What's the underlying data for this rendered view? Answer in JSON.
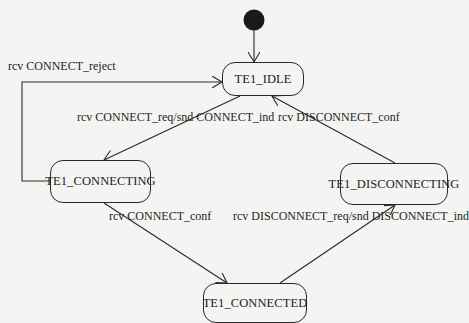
{
  "diagram": {
    "type": "state-machine",
    "initial_state": "TE1_IDLE",
    "states": [
      {
        "id": "idle",
        "label": "TE1_IDLE"
      },
      {
        "id": "connecting",
        "label": "TE1_CONNECTING"
      },
      {
        "id": "disconnecting",
        "label": "TE1_DISCONNECTING"
      },
      {
        "id": "connected",
        "label": "TE1_CONNECTED"
      }
    ],
    "transitions": [
      {
        "from": "TE1_CONNECTING",
        "to": "TE1_IDLE",
        "label": "rcv CONNECT_reject"
      },
      {
        "from": "TE1_IDLE",
        "to": "TE1_CONNECTING",
        "label": "rcv CONNECT_req/snd CONNECT_ind"
      },
      {
        "from": "TE1_DISCONNECTING",
        "to": "TE1_IDLE",
        "label": "rcv DISCONNECT_conf"
      },
      {
        "from": "TE1_CONNECTING",
        "to": "TE1_CONNECTED",
        "label": "rcv CONNECT_conf"
      },
      {
        "from": "TE1_CONNECTED",
        "to": "TE1_DISCONNECTING",
        "label": "rcv DISCONNECT_req/snd DISCONNECT_ind"
      }
    ]
  },
  "colors": {
    "stroke": "#2a2a2a",
    "background": "#f4f4f2",
    "faded_text": "#d9d9d6"
  }
}
